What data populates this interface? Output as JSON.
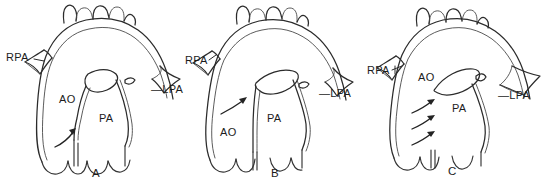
{
  "figure": {
    "width": 546,
    "height": 189,
    "background_color": "#ffffff",
    "line_color": "#2b2b2b",
    "text_color": "#1c1c1c",
    "style": "black-and-white anatomical line drawing"
  },
  "panels": [
    {
      "id": "a",
      "letter": "A",
      "labels": [
        {
          "key": "rpa",
          "text": "RPA",
          "x": 6,
          "y": 52
        },
        {
          "key": "ao",
          "text": "AO",
          "x": 59,
          "y": 94
        },
        {
          "key": "pa",
          "text": "PA",
          "x": 99,
          "y": 113
        },
        {
          "key": "lpa",
          "text": "—LPA",
          "x": 151,
          "y": 84
        }
      ],
      "arrows": [
        {
          "key": "flow-arrow-1",
          "from_x": 56,
          "from_y": 146,
          "to_x": 76,
          "to_y": 129
        }
      ],
      "arrow_count": 1,
      "arch_branch_count": 3
    },
    {
      "id": "b",
      "letter": "B",
      "labels": [
        {
          "key": "rpa",
          "text": "RPA",
          "x": 3,
          "y": 55
        },
        {
          "key": "ao",
          "text": "AO",
          "x": 38,
          "y": 127
        },
        {
          "key": "pa",
          "text": "PA",
          "x": 85,
          "y": 113
        },
        {
          "key": "lpa",
          "text": "—LPA",
          "x": 137,
          "y": 88
        }
      ],
      "arrows": [
        {
          "key": "flow-arrow-1",
          "from_x": 40,
          "from_y": 113,
          "to_x": 63,
          "to_y": 99
        }
      ],
      "arrow_count": 1,
      "arch_branch_count": 3
    },
    {
      "id": "c",
      "letter": "C",
      "labels": [
        {
          "key": "rpa",
          "text": "RPA",
          "x": 3,
          "y": 65
        },
        {
          "key": "ao",
          "text": "AO",
          "x": 54,
          "y": 72
        },
        {
          "key": "pa",
          "text": "PA",
          "x": 88,
          "y": 103
        },
        {
          "key": "lpa",
          "text": "—LPA",
          "x": 134,
          "y": 90
        }
      ],
      "arrows": [
        {
          "key": "flow-arrow-1",
          "from_x": 50,
          "from_y": 112,
          "to_x": 70,
          "to_y": 100
        },
        {
          "key": "flow-arrow-2",
          "from_x": 50,
          "from_y": 128,
          "to_x": 70,
          "to_y": 116
        },
        {
          "key": "flow-arrow-3",
          "from_x": 50,
          "from_y": 144,
          "to_x": 70,
          "to_y": 132
        }
      ],
      "arrow_count": 3,
      "arch_branch_count": 3
    }
  ],
  "panel_letters": [
    {
      "key": "a",
      "text": "A",
      "x": 92,
      "y": 168
    },
    {
      "key": "b",
      "text": "B",
      "x": 271,
      "y": 168
    },
    {
      "key": "c",
      "text": "C",
      "x": 448,
      "y": 166
    }
  ],
  "legend_terms": {
    "RPA": "right pulmonary artery",
    "LPA": "left pulmonary artery",
    "AO": "aorta",
    "PA": "pulmonary artery"
  }
}
